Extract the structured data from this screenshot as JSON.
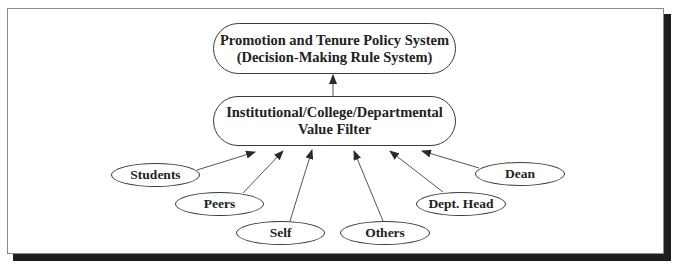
{
  "diagram": {
    "type": "flow",
    "top_box": {
      "line1": "Promotion and Tenure Policy System",
      "line2": "(Decision-Making Rule System)"
    },
    "middle_box": {
      "line1": "Institutional/College/Departmental",
      "line2": "Value Filter"
    },
    "inputs": [
      {
        "label": "Students"
      },
      {
        "label": "Peers"
      },
      {
        "label": "Self"
      },
      {
        "label": "Others"
      },
      {
        "label": "Dept. Head"
      },
      {
        "label": "Dean"
      }
    ],
    "edges": [
      {
        "from": "Value Filter",
        "to": "Promotion and Tenure Policy System"
      },
      {
        "from": "Students",
        "to": "Value Filter"
      },
      {
        "from": "Peers",
        "to": "Value Filter"
      },
      {
        "from": "Self",
        "to": "Value Filter"
      },
      {
        "from": "Others",
        "to": "Value Filter"
      },
      {
        "from": "Dept. Head",
        "to": "Value Filter"
      },
      {
        "from": "Dean",
        "to": "Value Filter"
      }
    ],
    "colors": {
      "line": "#3a3a3a",
      "text": "#222222",
      "shadow": "#1e1e1e",
      "frame_border": "#8a8a8a"
    }
  }
}
